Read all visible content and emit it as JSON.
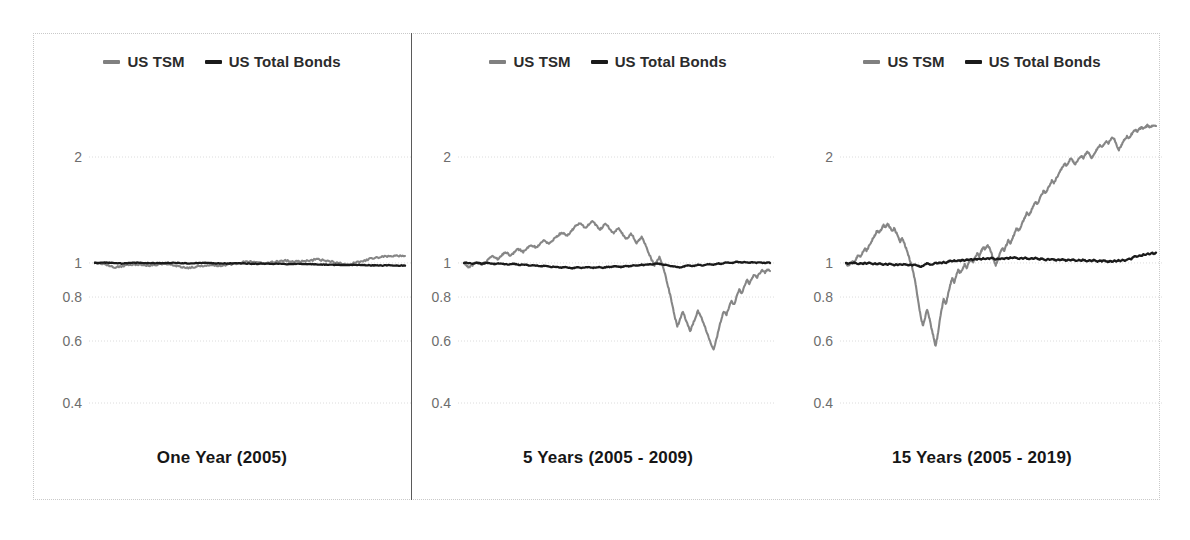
{
  "legend": {
    "tsm_label": "US TSM",
    "bonds_label": "US Total Bonds"
  },
  "colors": {
    "tsm": "#808080",
    "bonds": "#1a1a1a",
    "gridline": "#dcdcdc",
    "tick_text": "#6d6d6d",
    "title_text": "#161616",
    "frame": "#c9c9c9",
    "divider": "#5a5a5a",
    "background": "#ffffff"
  },
  "panels": [
    {
      "title": "One Year (2005)"
    },
    {
      "title": "5 Years (2005 - 2009)"
    },
    {
      "title": "15 Years (2005 - 2019)"
    }
  ],
  "chart_data": [
    {
      "type": "line",
      "title": "One Year (2005)",
      "xlabel": "",
      "ylabel": "",
      "yscale": "log",
      "ylim": [
        0.35,
        2.6
      ],
      "yticks": [
        2,
        1,
        0.8,
        0.6,
        0.4
      ],
      "ytick_labels": [
        "2",
        "1",
        "0.8",
        "0.6",
        "0.4"
      ],
      "grid": true,
      "legend_position": "top-center",
      "x_range": "2005",
      "series": [
        {
          "name": "US TSM",
          "color": "#808080",
          "values": [
            1.0,
            0.996,
            0.988,
            0.978,
            0.972,
            0.976,
            0.985,
            0.99,
            0.992,
            0.988,
            0.983,
            0.986,
            0.991,
            0.994,
            0.99,
            0.984,
            0.978,
            0.972,
            0.968,
            0.974,
            0.98,
            0.985,
            0.988,
            0.986,
            0.982,
            0.986,
            0.992,
            0.998,
            1.004,
            1.008,
            1.006,
            1.002,
            0.998,
            1.0,
            1.006,
            1.012,
            1.016,
            1.014,
            1.01,
            1.008,
            1.012,
            1.018,
            1.022,
            1.02,
            1.014,
            1.008,
            1.002,
            0.996,
            0.992,
            0.996,
            1.004,
            1.014,
            1.024,
            1.032,
            1.038,
            1.042,
            1.046,
            1.048,
            1.046,
            1.05
          ]
        },
        {
          "name": "US Total Bonds",
          "color": "#1a1a1a",
          "values": [
            1.0,
            1.001,
            1.002,
            1.0,
            0.998,
            0.997,
            0.998,
            1.0,
            1.001,
            1.0,
            0.999,
            0.998,
            0.999,
            1.0,
            1.001,
            1.0,
            0.999,
            0.998,
            0.997,
            0.998,
            0.999,
            1.0,
            0.999,
            0.998,
            0.997,
            0.996,
            0.997,
            0.998,
            0.997,
            0.996,
            0.995,
            0.994,
            0.995,
            0.996,
            0.995,
            0.994,
            0.993,
            0.992,
            0.993,
            0.994,
            0.993,
            0.992,
            0.991,
            0.99,
            0.989,
            0.988,
            0.987,
            0.986,
            0.987,
            0.988,
            0.987,
            0.986,
            0.985,
            0.984,
            0.983,
            0.984,
            0.985,
            0.984,
            0.983,
            0.984
          ]
        }
      ]
    },
    {
      "type": "line",
      "title": "5 Years (2005 - 2009)",
      "xlabel": "",
      "ylabel": "",
      "yscale": "log",
      "ylim": [
        0.35,
        2.6
      ],
      "yticks": [
        2,
        1,
        0.8,
        0.6,
        0.4
      ],
      "ytick_labels": [
        "2",
        "1",
        "0.8",
        "0.6",
        "0.4"
      ],
      "grid": true,
      "legend_position": "top-center",
      "x_range": "2005-2009",
      "series": [
        {
          "name": "US TSM",
          "color": "#808080",
          "values": [
            1.0,
            0.985,
            0.972,
            0.982,
            0.995,
            1.005,
            0.998,
            0.99,
            1.0,
            1.015,
            1.03,
            1.045,
            1.038,
            1.025,
            1.04,
            1.058,
            1.072,
            1.065,
            1.05,
            1.062,
            1.08,
            1.095,
            1.088,
            1.075,
            1.09,
            1.11,
            1.125,
            1.118,
            1.105,
            1.12,
            1.14,
            1.155,
            1.148,
            1.135,
            1.15,
            1.17,
            1.19,
            1.205,
            1.22,
            1.21,
            1.195,
            1.215,
            1.24,
            1.265,
            1.285,
            1.3,
            1.285,
            1.26,
            1.275,
            1.295,
            1.31,
            1.29,
            1.265,
            1.245,
            1.27,
            1.295,
            1.275,
            1.24,
            1.215,
            1.235,
            1.255,
            1.23,
            1.195,
            1.165,
            1.185,
            1.21,
            1.18,
            1.14,
            1.16,
            1.185,
            1.15,
            1.105,
            1.06,
            1.02,
            0.985,
            1.01,
            1.04,
            0.995,
            0.94,
            0.88,
            0.82,
            0.76,
            0.7,
            0.66,
            0.69,
            0.73,
            0.7,
            0.665,
            0.64,
            0.67,
            0.7,
            0.73,
            0.71,
            0.68,
            0.65,
            0.62,
            0.59,
            0.565,
            0.6,
            0.645,
            0.69,
            0.73,
            0.71,
            0.745,
            0.78,
            0.76,
            0.8,
            0.84,
            0.82,
            0.86,
            0.895,
            0.875,
            0.905,
            0.93,
            0.91,
            0.935,
            0.955,
            0.94,
            0.958,
            0.95
          ]
        },
        {
          "name": "US Total Bonds",
          "color": "#1a1a1a",
          "values": [
            1.0,
            1.002,
            0.999,
            0.996,
            0.998,
            1.001,
            0.998,
            0.995,
            0.997,
            1.0,
            0.998,
            0.995,
            0.993,
            0.996,
            0.998,
            0.995,
            0.992,
            0.99,
            0.993,
            0.995,
            0.992,
            0.989,
            0.987,
            0.99,
            0.988,
            0.985,
            0.982,
            0.985,
            0.983,
            0.98,
            0.978,
            0.981,
            0.979,
            0.976,
            0.974,
            0.977,
            0.975,
            0.972,
            0.97,
            0.973,
            0.971,
            0.968,
            0.966,
            0.969,
            0.972,
            0.97,
            0.967,
            0.97,
            0.973,
            0.971,
            0.968,
            0.971,
            0.974,
            0.972,
            0.969,
            0.972,
            0.975,
            0.973,
            0.976,
            0.979,
            0.977,
            0.974,
            0.977,
            0.98,
            0.978,
            0.981,
            0.984,
            0.982,
            0.985,
            0.988,
            0.986,
            0.989,
            0.992,
            0.99,
            0.993,
            0.996,
            0.994,
            0.991,
            0.988,
            0.985,
            0.982,
            0.979,
            0.976,
            0.973,
            0.97,
            0.975,
            0.98,
            0.985,
            0.982,
            0.979,
            0.984,
            0.989,
            0.986,
            0.983,
            0.988,
            0.993,
            0.99,
            0.987,
            0.992,
            0.997,
            0.994,
            0.999,
            1.004,
            1.001,
            0.998,
            1.003,
            1.008,
            1.005,
            1.002,
            1.007,
            1.004,
            1.001,
            1.006,
            1.003,
            1.0,
            1.005,
            1.002,
            0.999,
            1.004,
            1.001
          ]
        }
      ]
    },
    {
      "type": "line",
      "title": "15 Years (2005 - 2019)",
      "xlabel": "",
      "ylabel": "",
      "yscale": "log",
      "ylim": [
        0.35,
        2.6
      ],
      "yticks": [
        2,
        1,
        0.8,
        0.6,
        0.4
      ],
      "ytick_labels": [
        "2",
        "1",
        "0.8",
        "0.6",
        "0.4"
      ],
      "grid": true,
      "legend_position": "top-center",
      "x_range": "2005-2019",
      "series": [
        {
          "name": "US TSM",
          "color": "#808080",
          "values": [
            1.0,
            0.98,
            0.995,
            1.015,
            1.0,
            1.03,
            1.055,
            1.04,
            1.07,
            1.1,
            1.085,
            1.115,
            1.145,
            1.175,
            1.205,
            1.235,
            1.215,
            1.25,
            1.28,
            1.26,
            1.29,
            1.265,
            1.23,
            1.255,
            1.225,
            1.19,
            1.15,
            1.175,
            1.14,
            1.095,
            1.05,
            1.005,
            0.96,
            0.9,
            0.83,
            0.76,
            0.7,
            0.66,
            0.7,
            0.74,
            0.7,
            0.655,
            0.62,
            0.58,
            0.62,
            0.68,
            0.74,
            0.79,
            0.76,
            0.81,
            0.86,
            0.905,
            0.88,
            0.925,
            0.955,
            0.935,
            0.965,
            0.99,
            0.97,
            1.0,
            1.025,
            1.005,
            1.035,
            1.065,
            1.045,
            1.08,
            1.11,
            1.09,
            1.125,
            1.1,
            1.06,
            1.02,
            0.985,
            1.025,
            1.065,
            1.105,
            1.08,
            1.12,
            1.16,
            1.135,
            1.175,
            1.215,
            1.255,
            1.23,
            1.27,
            1.31,
            1.35,
            1.39,
            1.365,
            1.405,
            1.45,
            1.495,
            1.47,
            1.515,
            1.56,
            1.605,
            1.58,
            1.625,
            1.67,
            1.715,
            1.69,
            1.735,
            1.78,
            1.825,
            1.87,
            1.915,
            1.885,
            1.935,
            1.98,
            1.95,
            1.9,
            1.935,
            1.975,
            2.015,
            1.985,
            2.03,
            2.07,
            2.04,
            1.98,
            2.02,
            2.07,
            2.12,
            2.16,
            2.13,
            2.175,
            2.215,
            2.185,
            2.23,
            2.27,
            2.24,
            2.16,
            2.09,
            2.14,
            2.195,
            2.245,
            2.29,
            2.265,
            2.31,
            2.35,
            2.39,
            2.36,
            2.4,
            2.43,
            2.41,
            2.44,
            2.46,
            2.43,
            2.455,
            2.47,
            2.45
          ]
        },
        {
          "name": "US Total Bonds",
          "color": "#1a1a1a",
          "values": [
            1.0,
            0.996,
            1.002,
            0.997,
            1.003,
            0.998,
            0.993,
            0.999,
            0.994,
            1.0,
            0.995,
            1.001,
            0.996,
            0.991,
            0.997,
            0.992,
            0.998,
            0.993,
            0.988,
            0.994,
            0.989,
            0.995,
            0.99,
            0.985,
            0.991,
            0.986,
            0.992,
            0.987,
            0.993,
            0.988,
            0.983,
            0.989,
            0.984,
            0.99,
            0.985,
            0.98,
            0.975,
            0.982,
            0.99,
            0.998,
            0.992,
            0.986,
            0.994,
            1.002,
            0.996,
            1.004,
            0.998,
            1.006,
            1.0,
            1.008,
            1.015,
            1.009,
            1.017,
            1.011,
            1.019,
            1.013,
            1.021,
            1.015,
            1.023,
            1.017,
            1.025,
            1.019,
            1.027,
            1.021,
            1.029,
            1.023,
            1.031,
            1.025,
            1.033,
            1.027,
            1.035,
            1.029,
            1.022,
            1.03,
            1.024,
            1.032,
            1.026,
            1.034,
            1.028,
            1.036,
            1.03,
            1.038,
            1.032,
            1.026,
            1.034,
            1.028,
            1.036,
            1.03,
            1.024,
            1.032,
            1.026,
            1.034,
            1.028,
            1.022,
            1.03,
            1.024,
            1.018,
            1.026,
            1.02,
            1.028,
            1.022,
            1.016,
            1.024,
            1.018,
            1.026,
            1.02,
            1.014,
            1.022,
            1.016,
            1.024,
            1.018,
            1.012,
            1.02,
            1.014,
            1.022,
            1.016,
            1.01,
            1.018,
            1.012,
            1.02,
            1.014,
            1.008,
            1.016,
            1.01,
            1.018,
            1.012,
            1.006,
            1.014,
            1.008,
            1.016,
            1.01,
            1.018,
            1.012,
            1.02,
            1.014,
            1.022,
            1.03,
            1.024,
            1.038,
            1.046,
            1.04,
            1.052,
            1.046,
            1.058,
            1.052,
            1.064,
            1.058,
            1.07,
            1.062,
            1.068
          ]
        }
      ]
    }
  ]
}
